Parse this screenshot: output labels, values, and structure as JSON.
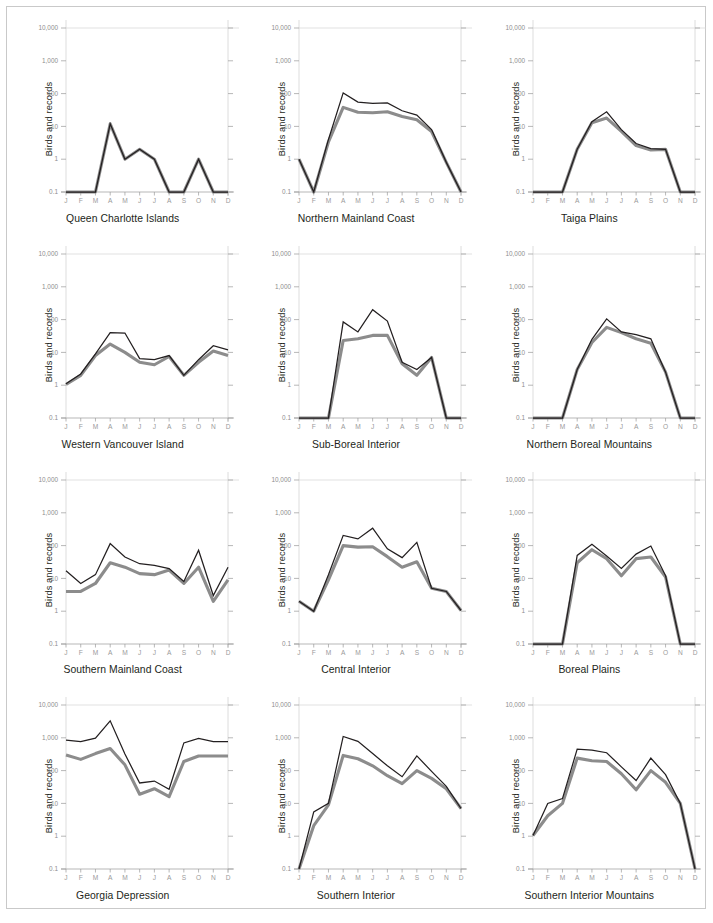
{
  "figure": {
    "ylabel": "Birds and records",
    "months": [
      "J",
      "F",
      "M",
      "A",
      "M",
      "J",
      "J",
      "A",
      "S",
      "O",
      "N",
      "D"
    ],
    "y_ticks": [
      "10,000",
      "1,000",
      "100",
      "10",
      "1",
      "0.1"
    ],
    "colors": {
      "birds_line": "#231f20",
      "records_line": "#8c8c8c",
      "gridline": "#d4d4d4",
      "axis": "#9a9a9a",
      "frame": "#c9c9c9",
      "text": "#231f20"
    }
  },
  "chart_data": [
    {
      "type": "line",
      "title": "Queen Charlotte Islands",
      "xlabel": "",
      "ylabel": "Birds and records",
      "categories": [
        "J",
        "F",
        "M",
        "A",
        "M",
        "J",
        "J",
        "A",
        "S",
        "O",
        "N",
        "D"
      ],
      "ylim": [
        0.1,
        10000
      ],
      "yscale": "log",
      "yticks": [
        0.1,
        1,
        10,
        100,
        1000,
        10000
      ],
      "grid": "top-only",
      "series": [
        {
          "name": "Birds",
          "values": [
            0.1,
            0.1,
            0.1,
            12,
            1,
            2,
            1,
            0.1,
            0.1,
            1,
            0.1,
            0.1
          ]
        },
        {
          "name": "Records",
          "values": [
            0.1,
            0.1,
            0.1,
            12,
            1,
            2,
            1,
            0.1,
            0.1,
            1,
            0.1,
            0.1
          ]
        }
      ]
    },
    {
      "type": "line",
      "title": "Northern Mainland Coast",
      "xlabel": "",
      "ylabel": "Birds and records",
      "categories": [
        "J",
        "F",
        "M",
        "A",
        "M",
        "J",
        "J",
        "A",
        "S",
        "O",
        "N",
        "D"
      ],
      "ylim": [
        0.1,
        10000
      ],
      "yscale": "log",
      "yticks": [
        0.1,
        1,
        10,
        100,
        1000,
        10000
      ],
      "grid": "top-only",
      "series": [
        {
          "name": "Birds",
          "values": [
            1,
            0.1,
            4,
            105,
            55,
            50,
            52,
            30,
            22,
            8,
            0.8,
            0.1
          ]
        },
        {
          "name": "Records",
          "values": [
            1,
            0.1,
            3.4,
            38,
            27,
            26,
            28,
            20,
            16,
            7,
            0.8,
            0.1
          ]
        }
      ]
    },
    {
      "type": "line",
      "title": "Taiga Plains",
      "xlabel": "",
      "ylabel": "Birds and records",
      "categories": [
        "J",
        "F",
        "M",
        "A",
        "M",
        "J",
        "J",
        "A",
        "S",
        "O",
        "N",
        "D"
      ],
      "ylim": [
        0.1,
        10000
      ],
      "yscale": "log",
      "yticks": [
        0.1,
        1,
        10,
        100,
        1000,
        10000
      ],
      "grid": "top-only",
      "series": [
        {
          "name": "Birds",
          "values": [
            0.1,
            0.1,
            0.1,
            2.0,
            14,
            28,
            8,
            3,
            2.1,
            2.0,
            0.1,
            0.1
          ]
        },
        {
          "name": "Records",
          "values": [
            0.1,
            0.1,
            0.1,
            2.0,
            13,
            18,
            7,
            2.6,
            1.9,
            2.0,
            0.1,
            0.1
          ]
        }
      ]
    },
    {
      "type": "line",
      "title": "Western Vancouver Island",
      "xlabel": "",
      "ylabel": "Birds and records",
      "categories": [
        "J",
        "F",
        "M",
        "A",
        "M",
        "J",
        "J",
        "A",
        "S",
        "O",
        "N",
        "D"
      ],
      "ylim": [
        0.1,
        10000
      ],
      "yscale": "log",
      "yticks": [
        0.1,
        1,
        10,
        100,
        1000,
        10000
      ],
      "grid": "top-only",
      "series": [
        {
          "name": "Birds",
          "values": [
            1.1,
            2.2,
            9,
            40,
            39,
            6.5,
            6,
            8,
            2,
            6,
            16,
            12,
            5
          ]
        },
        {
          "name": "Records",
          "values": [
            1.05,
            2.0,
            8,
            18,
            10,
            5,
            4.2,
            7.5,
            2,
            5,
            11,
            8,
            3
          ]
        }
      ]
    },
    {
      "type": "line",
      "title": "Sub-Boreal Interior",
      "xlabel": "",
      "ylabel": "Birds and records",
      "categories": [
        "J",
        "F",
        "M",
        "A",
        "M",
        "J",
        "J",
        "A",
        "S",
        "O",
        "N",
        "D"
      ],
      "ylim": [
        0.1,
        10000
      ],
      "yscale": "log",
      "yticks": [
        0.1,
        1,
        10,
        100,
        1000,
        10000
      ],
      "grid": "top-only",
      "series": [
        {
          "name": "Birds",
          "values": [
            0.1,
            0.1,
            0.1,
            85,
            42,
            200,
            90,
            5,
            3,
            7,
            0.1,
            0.1
          ]
        },
        {
          "name": "Records",
          "values": [
            0.1,
            0.1,
            0.1,
            23,
            26,
            33,
            33,
            4.5,
            2,
            7,
            0.1,
            0.1
          ]
        }
      ]
    },
    {
      "type": "line",
      "title": "Northern Boreal Mountains",
      "xlabel": "",
      "ylabel": "Birds and records",
      "categories": [
        "J",
        "F",
        "M",
        "A",
        "M",
        "J",
        "J",
        "A",
        "S",
        "O",
        "N",
        "D"
      ],
      "ylim": [
        0.1,
        10000
      ],
      "yscale": "log",
      "yticks": [
        0.1,
        1,
        10,
        100,
        1000,
        10000
      ],
      "grid": "top-only",
      "series": [
        {
          "name": "Birds",
          "values": [
            0.1,
            0.1,
            0.1,
            3,
            25,
            105,
            42,
            35,
            26,
            2.5,
            0.1,
            0.1
          ]
        },
        {
          "name": "Records",
          "values": [
            0.1,
            0.1,
            0.1,
            3,
            20,
            58,
            40,
            26,
            19,
            2.5,
            0.1,
            0.1
          ]
        }
      ]
    },
    {
      "type": "line",
      "title": "Southern Mainland Coast",
      "xlabel": "",
      "ylabel": "Birds and records",
      "categories": [
        "J",
        "F",
        "M",
        "A",
        "M",
        "J",
        "J",
        "A",
        "S",
        "O",
        "N",
        "D"
      ],
      "ylim": [
        0.1,
        10000
      ],
      "yscale": "log",
      "yticks": [
        0.1,
        1,
        10,
        100,
        1000,
        10000
      ],
      "grid": "top-only",
      "series": [
        {
          "name": "Birds",
          "values": [
            17,
            7,
            13,
            115,
            45,
            28,
            25,
            20,
            8,
            72,
            3,
            22,
            29
          ]
        },
        {
          "name": "Records",
          "values": [
            4,
            4,
            7,
            30,
            22,
            14,
            13,
            18,
            7,
            22,
            2,
            9,
            5
          ]
        }
      ]
    },
    {
      "type": "line",
      "title": "Central Interior",
      "xlabel": "",
      "ylabel": "Birds and records",
      "categories": [
        "J",
        "F",
        "M",
        "A",
        "M",
        "J",
        "J",
        "A",
        "S",
        "O",
        "N",
        "D"
      ],
      "ylim": [
        0.1,
        10000
      ],
      "yscale": "log",
      "yticks": [
        0.1,
        1,
        10,
        100,
        1000,
        10000
      ],
      "grid": "top-only",
      "series": [
        {
          "name": "Birds",
          "values": [
            2,
            1,
            13,
            205,
            160,
            340,
            80,
            43,
            125,
            5,
            4,
            1.05
          ]
        },
        {
          "name": "Records",
          "values": [
            2,
            1,
            9,
            100,
            90,
            92,
            46,
            22,
            32,
            5,
            4,
            1.05
          ]
        }
      ]
    },
    {
      "type": "line",
      "title": "Boreal Plains",
      "xlabel": "",
      "ylabel": "Birds and records",
      "categories": [
        "J",
        "F",
        "M",
        "A",
        "M",
        "J",
        "J",
        "A",
        "S",
        "O",
        "N",
        "D"
      ],
      "ylim": [
        0.1,
        10000
      ],
      "yscale": "log",
      "yticks": [
        0.1,
        1,
        10,
        100,
        1000,
        10000
      ],
      "grid": "top-only",
      "series": [
        {
          "name": "Birds",
          "values": [
            0.1,
            0.1,
            0.1,
            50,
            110,
            48,
            20,
            55,
            97,
            12,
            0.1,
            0.1
          ]
        },
        {
          "name": "Records",
          "values": [
            0.1,
            0.1,
            0.1,
            30,
            75,
            40,
            12,
            40,
            45,
            11,
            0.1,
            0.1
          ]
        }
      ]
    },
    {
      "type": "line",
      "title": "Georgia Depression",
      "xlabel": "",
      "ylabel": "Birds and records",
      "categories": [
        "J",
        "F",
        "M",
        "A",
        "M",
        "J",
        "J",
        "A",
        "S",
        "O",
        "N",
        "D"
      ],
      "ylim": [
        0.1,
        10000
      ],
      "yscale": "log",
      "yticks": [
        0.1,
        1,
        10,
        100,
        1000,
        10000
      ],
      "grid": "top-only",
      "series": [
        {
          "name": "Birds",
          "values": [
            850,
            760,
            980,
            3300,
            320,
            42,
            48,
            27,
            700,
            960,
            760,
            760
          ]
        },
        {
          "name": "Records",
          "values": [
            300,
            220,
            330,
            470,
            150,
            19,
            28,
            16,
            190,
            280,
            280,
            280
          ]
        }
      ]
    },
    {
      "type": "line",
      "title": "Southern Interior",
      "xlabel": "",
      "ylabel": "Birds and records",
      "categories": [
        "J",
        "F",
        "M",
        "A",
        "M",
        "J",
        "J",
        "A",
        "S",
        "O",
        "N",
        "D"
      ],
      "ylim": [
        0.1,
        10000
      ],
      "yscale": "log",
      "yticks": [
        0.1,
        1,
        10,
        100,
        1000,
        10000
      ],
      "grid": "top-only",
      "series": [
        {
          "name": "Birds",
          "values": [
            0.1,
            5.5,
            10,
            1100,
            780,
            330,
            140,
            65,
            280,
            95,
            33,
            7
          ]
        },
        {
          "name": "Records",
          "values": [
            0.1,
            2.1,
            9,
            290,
            230,
            140,
            70,
            40,
            100,
            58,
            28,
            7
          ]
        }
      ]
    },
    {
      "type": "line",
      "title": "Southern Interior Mountains",
      "xlabel": "",
      "ylabel": "Birds and records",
      "categories": [
        "J",
        "F",
        "M",
        "A",
        "M",
        "J",
        "J",
        "A",
        "S",
        "O",
        "N",
        "D"
      ],
      "ylim": [
        0.1,
        10000
      ],
      "yscale": "log",
      "yticks": [
        0.1,
        1,
        10,
        100,
        1000,
        10000
      ],
      "grid": "top-only",
      "series": [
        {
          "name": "Birds",
          "values": [
            1.05,
            10,
            14,
            450,
            420,
            350,
            130,
            50,
            240,
            75,
            10,
            0.1
          ]
        },
        {
          "name": "Records",
          "values": [
            1.05,
            4.2,
            10,
            240,
            200,
            190,
            80,
            26,
            100,
            44,
            10,
            0.1
          ]
        }
      ]
    }
  ]
}
